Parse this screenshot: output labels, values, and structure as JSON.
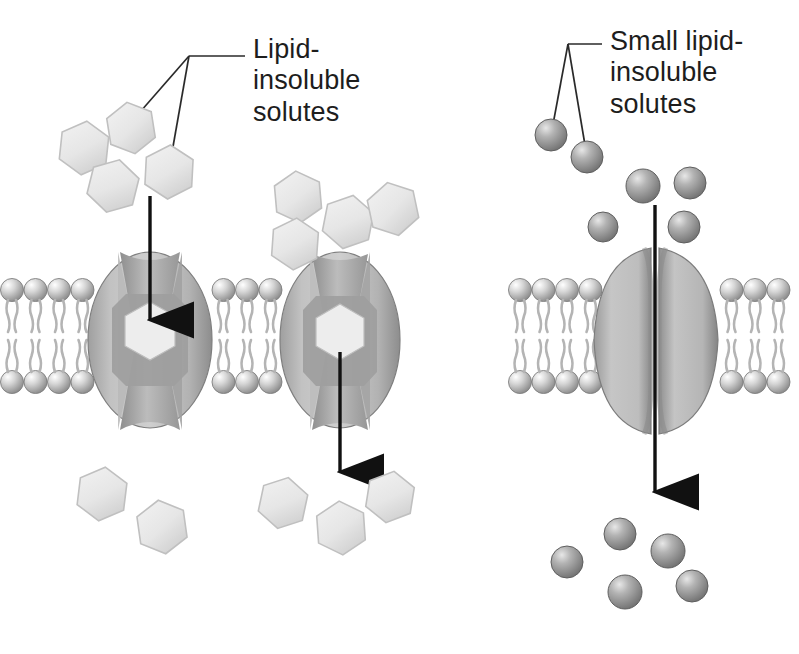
{
  "figure": {
    "background": "#ffffff",
    "width": 799,
    "height": 654
  },
  "labels": {
    "left": {
      "text": "Lipid-\ninsoluble\nsolutes",
      "x": 253,
      "y": 34,
      "leader_anchor": {
        "x": 245,
        "y": 56
      },
      "leader_targets": [
        {
          "x": 113,
          "y": 143
        },
        {
          "x": 168,
          "y": 175
        }
      ]
    },
    "right": {
      "text": "Small lipid-\ninsoluble\nsolutes",
      "x": 610,
      "y": 26,
      "leader_anchor": {
        "x": 602,
        "y": 44
      },
      "leader_targets": [
        {
          "x": 551,
          "y": 135
        },
        {
          "x": 587,
          "y": 157
        }
      ]
    }
  },
  "panels": [
    {
      "name": "carrier-mediated-facilitated-diffusion",
      "solute_shape": "hexagon",
      "solute_color": "#e8e8e8",
      "solute_stroke": "#b4b4b4",
      "membrane": {
        "x": 0,
        "y": 272,
        "width": 410,
        "height": 125
      },
      "proteins": [
        {
          "name": "carrier-protein-left",
          "cx": 150,
          "cy": 340,
          "rx": 62,
          "ry": 88,
          "pore": "hourglass",
          "bound_solute": true
        },
        {
          "name": "carrier-protein-right",
          "cx": 340,
          "cy": 340,
          "rx": 60,
          "ry": 88,
          "pore": "hourglass",
          "bound_solute": true
        }
      ],
      "arrows": [
        {
          "name": "influx-arrow",
          "x": 150,
          "y1": 196,
          "y2": 330,
          "direction": "down"
        },
        {
          "name": "efflux-arrow",
          "x": 340,
          "y1": 352,
          "y2": 482,
          "direction": "down"
        }
      ],
      "solutes_above": [
        {
          "x": 84,
          "y": 148,
          "r": 27,
          "rot": 6
        },
        {
          "x": 131,
          "y": 128,
          "r": 26,
          "rot": -9
        },
        {
          "x": 113,
          "y": 186,
          "r": 27,
          "rot": 14
        },
        {
          "x": 169,
          "y": 172,
          "r": 27,
          "rot": 3
        },
        {
          "x": 298,
          "y": 197,
          "r": 26,
          "rot": -5
        },
        {
          "x": 348,
          "y": 222,
          "r": 27,
          "rot": 11
        },
        {
          "x": 295,
          "y": 244,
          "r": 26,
          "rot": 4
        },
        {
          "x": 393,
          "y": 209,
          "r": 27,
          "rot": -12
        }
      ],
      "solutes_below": [
        {
          "x": 102,
          "y": 494,
          "r": 27,
          "rot": 7
        },
        {
          "x": 162,
          "y": 527,
          "r": 27,
          "rot": -8
        },
        {
          "x": 283,
          "y": 503,
          "r": 26,
          "rot": 12
        },
        {
          "x": 341,
          "y": 528,
          "r": 27,
          "rot": -4
        },
        {
          "x": 390,
          "y": 497,
          "r": 26,
          "rot": 9
        }
      ]
    },
    {
      "name": "channel-mediated-facilitated-diffusion",
      "solute_shape": "sphere",
      "solute_color": "#8e8e8e",
      "solute_stroke": "#6d6d6d",
      "membrane": {
        "x": 508,
        "y": 272,
        "width": 291,
        "height": 125
      },
      "proteins": [
        {
          "name": "channel-protein",
          "cx": 655,
          "cy": 340,
          "rx": 62,
          "ry": 92,
          "pore": "split-channel",
          "bound_solute": false
        }
      ],
      "arrows": [
        {
          "name": "flux-arrow",
          "x": 655,
          "y1": 205,
          "y2": 500,
          "direction": "down"
        }
      ],
      "solutes_above": [
        {
          "x": 551,
          "y": 135,
          "r": 16
        },
        {
          "x": 587,
          "y": 157,
          "r": 16
        },
        {
          "x": 643,
          "y": 186,
          "r": 17
        },
        {
          "x": 690,
          "y": 183,
          "r": 16
        },
        {
          "x": 684,
          "y": 227,
          "r": 16
        },
        {
          "x": 603,
          "y": 227,
          "r": 15
        }
      ],
      "solutes_below": [
        {
          "x": 620,
          "y": 534,
          "r": 16
        },
        {
          "x": 668,
          "y": 551,
          "r": 17
        },
        {
          "x": 567,
          "y": 562,
          "r": 16
        },
        {
          "x": 625,
          "y": 592,
          "r": 17
        },
        {
          "x": 692,
          "y": 586,
          "r": 16
        }
      ]
    }
  ],
  "colors": {
    "protein_light": "#c9c9c9",
    "protein_mid": "#a9a9a9",
    "protein_dark": "#8a8a8a",
    "head_light": "#d8d8d8",
    "head_dark": "#9a9a9a",
    "tail": "#b0b0b0",
    "line": "#1a1a1a"
  }
}
